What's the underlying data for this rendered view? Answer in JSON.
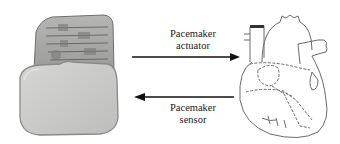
{
  "diagram": {
    "nodes": [
      {
        "id": "pacemaker",
        "label": "Pacemaker device",
        "icon": "pacemaker-icon"
      },
      {
        "id": "heart",
        "label": "Heart",
        "icon": "heart-icon"
      }
    ],
    "edges": [
      {
        "from": "pacemaker",
        "to": "heart",
        "label_line1": "Pacemaker",
        "label_line2": "actuator"
      },
      {
        "from": "heart",
        "to": "pacemaker",
        "label_line1": "Pacemaker",
        "label_line2": "sensor"
      }
    ]
  },
  "colors": {
    "device_body": "#c9c9c7",
    "device_outline": "#8a8a88",
    "arrow": "#111111",
    "heart_line": "#6a6a6a"
  }
}
